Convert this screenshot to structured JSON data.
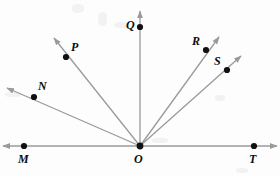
{
  "figure": {
    "background_color": "#fdfdfd",
    "line_color": "#9a9a9a",
    "point_color": "#111111",
    "label_color": "#0d0d0d",
    "width": 280,
    "height": 176
  },
  "origin": {
    "name": "O",
    "x": 140,
    "y": 146
  },
  "points": [
    {
      "id": "M",
      "label": "M",
      "x": 24,
      "y": 146,
      "label_x": 18,
      "label_y": 153
    },
    {
      "id": "N",
      "label": "N",
      "x": 34,
      "y": 97,
      "label_x": 38,
      "label_y": 80
    },
    {
      "id": "P",
      "label": "P",
      "x": 66,
      "y": 57,
      "label_x": 71,
      "label_y": 41
    },
    {
      "id": "Q",
      "label": "Q",
      "x": 140,
      "y": 27,
      "label_x": 126,
      "label_y": 19
    },
    {
      "id": "R",
      "label": "R",
      "x": 206,
      "y": 50,
      "label_x": 192,
      "label_y": 35
    },
    {
      "id": "S",
      "label": "S",
      "x": 227,
      "y": 70,
      "label_x": 214,
      "label_y": 55
    },
    {
      "id": "T",
      "label": "T",
      "x": 254,
      "y": 146,
      "label_x": 249,
      "label_y": 153
    },
    {
      "id": "O",
      "label": "O",
      "x": 140,
      "y": 146,
      "label_x": 134,
      "label_y": 153
    }
  ],
  "rays": [
    {
      "id": "ON",
      "from": "O",
      "through": "N",
      "tip_x": 7,
      "tip_y": 88
    },
    {
      "id": "OP",
      "from": "O",
      "through": "P",
      "tip_x": 54,
      "tip_y": 38
    },
    {
      "id": "OQ",
      "from": "O",
      "through": "Q",
      "tip_x": 140,
      "tip_y": 11
    },
    {
      "id": "OR",
      "from": "O",
      "through": "R",
      "tip_x": 219,
      "tip_y": 37
    },
    {
      "id": "OS",
      "from": "O",
      "through": "S",
      "tip_x": 241,
      "tip_y": 56
    }
  ],
  "base_line": {
    "id": "MT",
    "label": "line MT",
    "left_tip_x": 3,
    "right_tip_x": 277,
    "y": 146
  }
}
